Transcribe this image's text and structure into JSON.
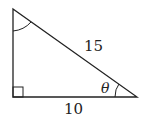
{
  "diagram": {
    "type": "right-triangle",
    "hypotenuse_label": "15",
    "base_label": "10",
    "angle_label": "θ",
    "right_angle_marker": true,
    "top_angle_arc": true,
    "stroke_color": "#222222"
  }
}
